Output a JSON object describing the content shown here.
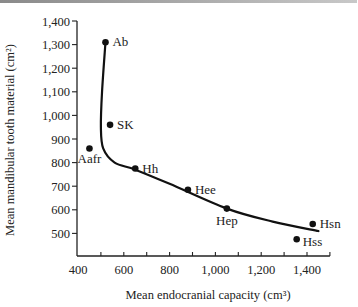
{
  "chart_data": {
    "type": "scatter",
    "title": "",
    "xlabel": "Mean endocranial capacity (cm³)",
    "ylabel": "Mean mandibular tooth material (cm²)",
    "xlim": [
      400,
      1500
    ],
    "ylim": [
      400,
      1400
    ],
    "x_ticks": [
      400,
      500,
      600,
      700,
      800,
      900,
      1000,
      1100,
      1200,
      1300,
      1400,
      1500
    ],
    "x_tick_labels": [
      "400",
      "600",
      "800",
      "1,000",
      "1,200",
      "1,400"
    ],
    "x_tick_label_values": [
      400,
      600,
      800,
      1000,
      1200,
      1400
    ],
    "y_ticks": [
      1400,
      1300,
      1200,
      1100,
      1000,
      900,
      800,
      700,
      600,
      500
    ],
    "y_tick_labels": [
      "1,400",
      "1,300",
      "1,200",
      "1,100",
      "1,000",
      "900",
      "800",
      "700",
      "600",
      "500"
    ],
    "grid": false,
    "legend": null,
    "points": [
      {
        "label": "Ab",
        "x": 520,
        "y": 1310
      },
      {
        "label": "SK",
        "x": 540,
        "y": 960
      },
      {
        "label": "Aafr",
        "x": 450,
        "y": 860
      },
      {
        "label": "Hh",
        "x": 650,
        "y": 775
      },
      {
        "label": "Hee",
        "x": 880,
        "y": 685
      },
      {
        "label": "Hep",
        "x": 1050,
        "y": 605
      },
      {
        "label": "Hsn",
        "x": 1425,
        "y": 540
      },
      {
        "label": "Hss",
        "x": 1355,
        "y": 475
      }
    ],
    "trend_curve": {
      "description": "hand-drawn fitted curve from Ab descending steeply then flattening toward Hsn",
      "points": [
        [
          520,
          1310
        ],
        [
          505,
          1100
        ],
        [
          500,
          950
        ],
        [
          510,
          860
        ],
        [
          560,
          800
        ],
        [
          650,
          770
        ],
        [
          800,
          710
        ],
        [
          1050,
          605
        ],
        [
          1250,
          550
        ],
        [
          1450,
          510
        ]
      ]
    }
  }
}
